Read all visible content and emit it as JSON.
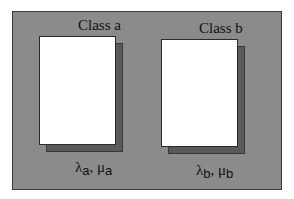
{
  "diagram": {
    "type": "two-class queueing diagram",
    "colors": {
      "frame_fill": "#8b8b8b",
      "card_fill": "#ffffff",
      "shadow_fill": "#5a5a5a",
      "border": "#2a2a2a",
      "text": "#111111"
    },
    "classes": [
      {
        "title": "Class a",
        "lambda_symbol": "λ",
        "mu_symbol": "μ",
        "subscript": "a",
        "separator": ", "
      },
      {
        "title": "Class b",
        "lambda_symbol": "λ",
        "mu_symbol": "μ",
        "subscript": "b",
        "separator": ", "
      }
    ]
  }
}
